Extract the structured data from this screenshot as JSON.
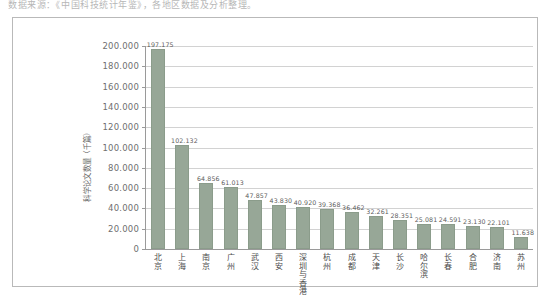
{
  "page": {
    "top_text": "数据来源：《中国科技统计年鉴》，各地区数据及分析整理。"
  },
  "chart_data": {
    "type": "bar",
    "title": "",
    "xlabel": "",
    "ylabel": "科学论文数量（千篇）",
    "ylim": [
      0,
      200000
    ],
    "ytick_labels": [
      "200.000",
      "180.000",
      "160.000",
      "140.000",
      "120.000",
      "100.000",
      "80.000",
      "60.000",
      "40.000",
      "20.000",
      "0"
    ],
    "ytick_values": [
      200000,
      180000,
      160000,
      140000,
      120000,
      100000,
      80000,
      60000,
      40000,
      20000,
      0
    ],
    "grid": true,
    "legend": "none",
    "categories": [
      "北京",
      "上海",
      "南京",
      "广州",
      "武汉",
      "西安",
      "深圳与香港",
      "杭州",
      "成都",
      "天津",
      "长沙",
      "哈尔滨",
      "长春",
      "合肥",
      "济南",
      "苏州"
    ],
    "values": [
      197175,
      102132,
      64856,
      61013,
      47857,
      43830,
      40920,
      39368,
      36462,
      32261,
      28351,
      25081,
      24591,
      23130,
      22101,
      11638
    ],
    "value_labels": [
      "197.175",
      "102.132",
      "64.856",
      "61.013",
      "47.857",
      "43.830",
      "40.920",
      "39.368",
      "36.462",
      "32.261",
      "28.351",
      "25.081",
      "24.591",
      "23.130",
      "22.101",
      "11.638"
    ],
    "bar_color": "#97a797",
    "grid_color": "#d2d2d2",
    "axis_color": "#9a9a9a"
  }
}
